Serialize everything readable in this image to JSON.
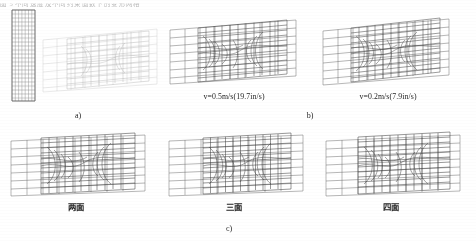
{
  "top_fragment": {
    "text": "图 5 不同速度及不同约束面数下的变形网格"
  },
  "figure": {
    "row_top": {
      "panels": [
        {
          "id": "panel-a",
          "label": "a)",
          "velocity_label": "",
          "has_reference_mesh": true,
          "note": "undeformed narrow strip at left plus faded deformed mesh"
        },
        {
          "id": "panel-b-left",
          "label": "",
          "velocity_label": "v=0.5m/s(19.7in/s)",
          "has_reference_mesh": false
        },
        {
          "id": "panel-b-right",
          "label": "b)",
          "velocity_label": "v=0.2m/s(7.9in/s)",
          "has_reference_mesh": false
        }
      ]
    },
    "row_bottom": {
      "group_label": "c)",
      "panels": [
        {
          "id": "panel-c-1",
          "label": "两面"
        },
        {
          "id": "panel-c-2",
          "label": "三面"
        },
        {
          "id": "panel-c-3",
          "label": "四面"
        }
      ]
    }
  },
  "colors": {
    "mesh_line": "#4a4a4a",
    "mesh_line_light": "#9a9a9a",
    "mesh_line_faint": "#c2c2c2",
    "inner_mesh": "#3a3a3a",
    "background": "#ffffff",
    "caption_text": "#262626"
  }
}
